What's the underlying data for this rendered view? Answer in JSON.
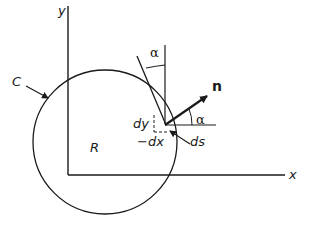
{
  "diagram": {
    "axes": {
      "x_label": "x",
      "y_label": "y"
    },
    "curve_label": "C",
    "region_label": "R",
    "normal_label": "n",
    "angle_label_top": "α",
    "angle_label_right": "α",
    "dy_label": "dy",
    "dx_label": "−dx",
    "ds_label": "ds",
    "colors": {
      "stroke": "#1a1a1a",
      "background": "#ffffff"
    }
  }
}
